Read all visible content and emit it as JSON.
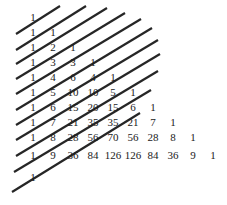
{
  "figure": {
    "background_color": "#ffffff",
    "width": 227,
    "height": 205
  },
  "chart_data": {
    "type": "table",
    "xlabel": "",
    "ylabel": "",
    "grid": false,
    "legend": null,
    "rows": [
      {
        "index": 0,
        "values": [
          1
        ]
      },
      {
        "index": 1,
        "values": [
          1,
          1
        ]
      },
      {
        "index": 2,
        "values": [
          1,
          2,
          1
        ]
      },
      {
        "index": 3,
        "values": [
          1,
          3,
          3,
          1
        ]
      },
      {
        "index": 4,
        "values": [
          1,
          4,
          6,
          4,
          1
        ]
      },
      {
        "index": 5,
        "values": [
          1,
          5,
          10,
          10,
          5,
          1
        ]
      },
      {
        "index": 6,
        "values": [
          1,
          6,
          15,
          20,
          15,
          6,
          1
        ]
      },
      {
        "index": 7,
        "values": [
          1,
          7,
          21,
          35,
          35,
          21,
          7,
          1
        ]
      },
      {
        "index": 8,
        "values": [
          1,
          8,
          28,
          56,
          70,
          56,
          28,
          8,
          1
        ]
      },
      {
        "index": 9,
        "values": [
          1,
          9,
          36,
          84,
          126,
          126,
          84,
          36,
          9,
          1
        ]
      },
      {
        "index": 10,
        "values": [
          1
        ]
      }
    ],
    "row_y": [
      17,
      32,
      47,
      62,
      77,
      92,
      107,
      122,
      137,
      155,
      177
    ],
    "row_start_x": [
      33,
      33,
      33,
      33,
      33,
      33,
      33,
      33,
      33,
      33,
      33
    ],
    "column_step": 20,
    "text_color": "#1a1a1a",
    "font_size": 11,
    "overlay": {
      "name": "shallow-diagonals",
      "count": 11,
      "color": "#262626",
      "width": 2.2,
      "description": "Diagonal lines drawn from lower-left to upper-right across the triangle; each sums to a Fibonacci number.",
      "lines": [
        {
          "x1": 16,
          "y1": 34,
          "x2": 60,
          "y2": 6
        },
        {
          "x1": 16,
          "y1": 50,
          "x2": 86,
          "y2": 6
        },
        {
          "x1": 16,
          "y1": 64,
          "x2": 107,
          "y2": 8
        },
        {
          "x1": 16,
          "y1": 79,
          "x2": 125,
          "y2": 13
        },
        {
          "x1": 16,
          "y1": 94,
          "x2": 141,
          "y2": 19
        },
        {
          "x1": 16,
          "y1": 110,
          "x2": 152,
          "y2": 28
        },
        {
          "x1": 16,
          "y1": 125,
          "x2": 158,
          "y2": 40
        },
        {
          "x1": 16,
          "y1": 140,
          "x2": 160,
          "y2": 54
        },
        {
          "x1": 16,
          "y1": 156,
          "x2": 158,
          "y2": 71
        },
        {
          "x1": 14,
          "y1": 172,
          "x2": 151,
          "y2": 90
        },
        {
          "x1": 12,
          "y1": 192,
          "x2": 140,
          "y2": 113
        }
      ]
    }
  }
}
